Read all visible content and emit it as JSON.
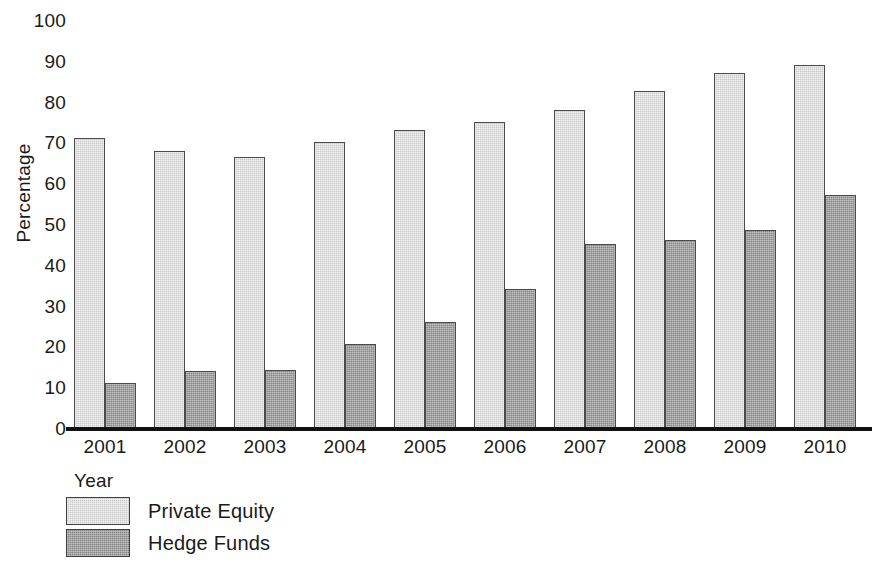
{
  "chart_data": {
    "type": "bar",
    "title": "",
    "xlabel": "Year",
    "ylabel": "Percentage",
    "categories": [
      "2001",
      "2002",
      "2003",
      "2004",
      "2005",
      "2006",
      "2007",
      "2008",
      "2009",
      "2010"
    ],
    "series": [
      {
        "name": "Private Equity",
        "color": "#c9c9c9",
        "values": [
          71,
          68,
          66.5,
          70,
          73,
          75,
          78,
          82.5,
          87,
          89
        ]
      },
      {
        "name": "Hedge Funds",
        "color": "#858585",
        "values": [
          11,
          14,
          14.2,
          20.5,
          26,
          34,
          45,
          46,
          48.5,
          57
        ]
      }
    ],
    "ylim": [
      0,
      100
    ],
    "y_ticks": [
      "0",
      "10",
      "20",
      "30",
      "40",
      "50",
      "60",
      "70",
      "80",
      "90",
      "100"
    ],
    "grid": false,
    "legend_position": "bottom-left"
  }
}
